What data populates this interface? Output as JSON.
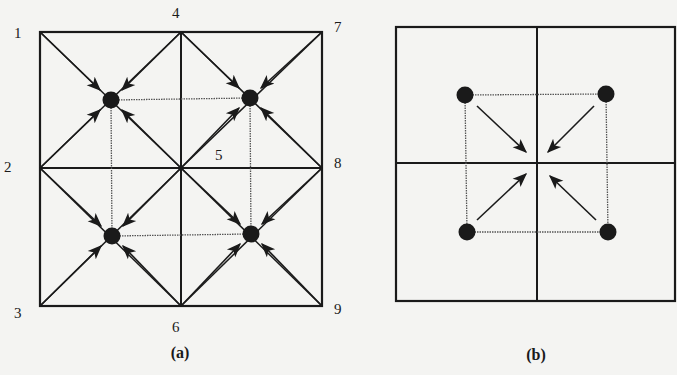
{
  "figure": {
    "background": "#f4f4f2",
    "ink_color": "#1a1a1a",
    "dotted_color": "#555555"
  },
  "panel_a": {
    "caption": "(a)",
    "caption_pos": [
      180,
      358
    ],
    "frame": {
      "x1": 40,
      "y1": 32,
      "x2": 322,
      "y2": 306
    },
    "mid": {
      "x": 181,
      "y": 168
    },
    "node_labels": [
      {
        "text": "1",
        "x": 14,
        "y": 38
      },
      {
        "text": "2",
        "x": 4,
        "y": 172
      },
      {
        "text": "3",
        "x": 14,
        "y": 318
      },
      {
        "text": "4",
        "x": 172,
        "y": 18
      },
      {
        "text": "5",
        "x": 215,
        "y": 160
      },
      {
        "text": "6",
        "x": 172,
        "y": 332
      },
      {
        "text": "7",
        "x": 334,
        "y": 32
      },
      {
        "text": "8",
        "x": 334,
        "y": 168
      },
      {
        "text": "9",
        "x": 334,
        "y": 314
      }
    ],
    "dots": [
      {
        "x": 111,
        "y": 100
      },
      {
        "x": 250,
        "y": 98
      },
      {
        "x": 112,
        "y": 236
      },
      {
        "x": 251,
        "y": 234
      }
    ],
    "arrows": [
      {
        "from": [
          40,
          32
        ],
        "to": [
          100,
          90
        ]
      },
      {
        "from": [
          181,
          32
        ],
        "to": [
          122,
          90
        ]
      },
      {
        "from": [
          40,
          168
        ],
        "to": [
          100,
          110
        ]
      },
      {
        "from": [
          181,
          168
        ],
        "to": [
          122,
          110
        ]
      },
      {
        "from": [
          181,
          32
        ],
        "to": [
          239,
          88
        ]
      },
      {
        "from": [
          322,
          32
        ],
        "to": [
          261,
          88
        ]
      },
      {
        "from": [
          181,
          168
        ],
        "to": [
          239,
          108
        ]
      },
      {
        "from": [
          322,
          168
        ],
        "to": [
          261,
          108
        ]
      },
      {
        "from": [
          40,
          168
        ],
        "to": [
          101,
          226
        ]
      },
      {
        "from": [
          181,
          168
        ],
        "to": [
          123,
          226
        ]
      },
      {
        "from": [
          40,
          306
        ],
        "to": [
          101,
          246
        ]
      },
      {
        "from": [
          181,
          306
        ],
        "to": [
          123,
          246
        ]
      },
      {
        "from": [
          181,
          168
        ],
        "to": [
          240,
          224
        ]
      },
      {
        "from": [
          322,
          168
        ],
        "to": [
          262,
          224
        ]
      },
      {
        "from": [
          181,
          306
        ],
        "to": [
          240,
          244
        ]
      },
      {
        "from": [
          322,
          306
        ],
        "to": [
          262,
          244
        ]
      }
    ]
  },
  "panel_b": {
    "caption": "(b)",
    "caption_pos": [
      536,
      360
    ],
    "frame": {
      "x1": 396,
      "y1": 27,
      "x2": 675,
      "y2": 301
    },
    "mid": {
      "x": 537,
      "y": 163
    },
    "dots": [
      {
        "x": 465,
        "y": 95
      },
      {
        "x": 606,
        "y": 94
      },
      {
        "x": 467,
        "y": 232
      },
      {
        "x": 608,
        "y": 232
      }
    ],
    "arrows": [
      {
        "from": [
          477,
          106
        ],
        "to": [
          526,
          152
        ]
      },
      {
        "from": [
          594,
          106
        ],
        "to": [
          548,
          152
        ]
      },
      {
        "from": [
          477,
          220
        ],
        "to": [
          526,
          174
        ]
      },
      {
        "from": [
          596,
          220
        ],
        "to": [
          550,
          176
        ]
      }
    ]
  }
}
